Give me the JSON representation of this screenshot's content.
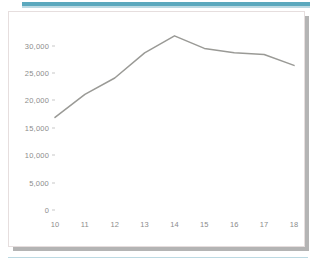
{
  "card": {
    "border_color": "#e6dede",
    "shadow_color": "#b4b4b4",
    "background": "#ffffff"
  },
  "decor": {
    "top_rule_color": "#5ba8bd",
    "top_rule_soft_color": "#bcd9e2",
    "bottom_rule_color": "#bcd9e2"
  },
  "chart_data": {
    "type": "line",
    "title": "",
    "subtitle": "",
    "xlabel": "",
    "ylabel": "",
    "categories": [
      10,
      11,
      12,
      13,
      14,
      15,
      16,
      17,
      18
    ],
    "x_tick_labels": [
      "10",
      "11",
      "12",
      "13",
      "14",
      "15",
      "16",
      "17",
      "18"
    ],
    "y_tick_values": [
      0,
      5000,
      10000,
      15000,
      20000,
      25000,
      30000
    ],
    "y_tick_labels": [
      "0",
      "5,000",
      "10,000",
      "15,000",
      "20,000",
      "25,000",
      "30,000"
    ],
    "ylim": [
      0,
      32500
    ],
    "xlim": [
      10,
      18
    ],
    "grid": false,
    "legend": false,
    "legend_position": "none",
    "series": [
      {
        "name": "",
        "color": "#9a9a96",
        "line_width": 1.5,
        "markers": false,
        "values": [
          16900,
          21100,
          24100,
          28700,
          31800,
          29500,
          28700,
          28400,
          26400
        ]
      }
    ],
    "annotations": []
  },
  "axis_style": {
    "label_color": "#8c8c8c",
    "tick_color": "#c8c8c8"
  }
}
